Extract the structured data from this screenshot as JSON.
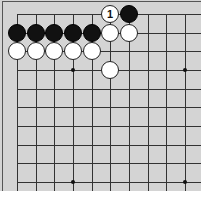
{
  "board": {
    "title": "Go board diagram",
    "grid": {
      "origin_x": 17,
      "origin_y": 14,
      "spacing": 18.65,
      "columns": 11,
      "rows": 10,
      "line_bottom": 191,
      "line_right": 201
    },
    "star_points": [
      {
        "col": 3,
        "row": 3
      },
      {
        "col": 9,
        "row": 3
      },
      {
        "col": 3,
        "row": 9
      },
      {
        "col": 9,
        "row": 9
      }
    ],
    "stones": [
      {
        "col": 5,
        "row": 0,
        "color": "white",
        "label": "1"
      },
      {
        "col": 6,
        "row": 0,
        "color": "black",
        "label": ""
      },
      {
        "col": 0,
        "row": 1,
        "color": "black",
        "label": ""
      },
      {
        "col": 1,
        "row": 1,
        "color": "black",
        "label": ""
      },
      {
        "col": 2,
        "row": 1,
        "color": "black",
        "label": ""
      },
      {
        "col": 3,
        "row": 1,
        "color": "black",
        "label": ""
      },
      {
        "col": 4,
        "row": 1,
        "color": "black",
        "label": ""
      },
      {
        "col": 5,
        "row": 1,
        "color": "white",
        "label": ""
      },
      {
        "col": 6,
        "row": 1,
        "color": "white",
        "label": ""
      },
      {
        "col": 0,
        "row": 2,
        "color": "white",
        "label": ""
      },
      {
        "col": 1,
        "row": 2,
        "color": "white",
        "label": ""
      },
      {
        "col": 2,
        "row": 2,
        "color": "white",
        "label": ""
      },
      {
        "col": 3,
        "row": 2,
        "color": "white",
        "label": ""
      },
      {
        "col": 4,
        "row": 2,
        "color": "white",
        "label": ""
      },
      {
        "col": 5,
        "row": 3,
        "color": "white",
        "label": ""
      }
    ],
    "colors": {
      "board": "#d4d4d4",
      "line": "#333333",
      "black_stone": "#111111",
      "white_stone": "#ffffff"
    }
  }
}
